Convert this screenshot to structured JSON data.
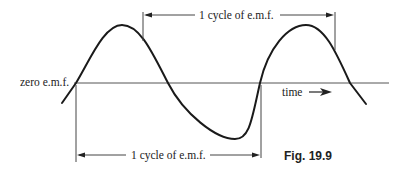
{
  "diagram": {
    "zero_label": "zero e.m.f.",
    "time_label": "time",
    "top_cycle_label": "1 cycle of e.m.f.",
    "bottom_cycle_label": "1 cycle of e.m.f.",
    "figure_caption": "Fig. 19.9",
    "colors": {
      "wave": "#1a1a1a",
      "lines": "#333333",
      "text": "#222222"
    }
  }
}
